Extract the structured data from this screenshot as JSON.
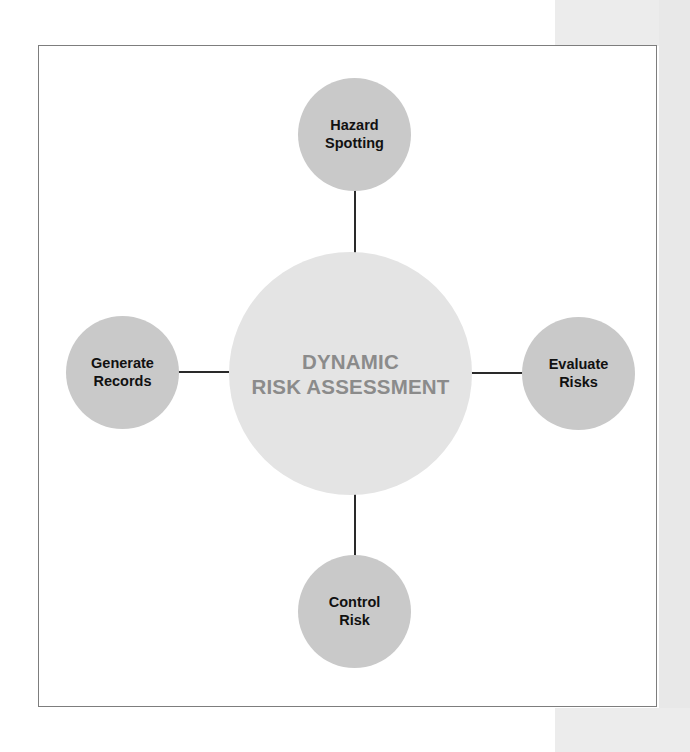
{
  "page": {
    "background_color": "#ffffff",
    "scan_margin_color": "#e8e8e8"
  },
  "frame": {
    "border_color": "#7d7d7d",
    "fill_color": "#ffffff"
  },
  "diagram": {
    "type": "hub-and-spoke",
    "center": {
      "id": "center",
      "label": "DYNAMIC\nRISK ASSESSMENT",
      "line1": "DYNAMIC",
      "line2": "RISK ASSESSMENT",
      "fill_color": "#e4e4e4",
      "text_color": "#8b8b8b"
    },
    "nodes": [
      {
        "id": "hazard-spotting",
        "label": "Hazard\nSpotting",
        "position": "top",
        "fill_color": "#c9c9c9",
        "text_color": "#111111"
      },
      {
        "id": "evaluate-risks",
        "label": "Evaluate\nRisks",
        "position": "right",
        "fill_color": "#c9c9c9",
        "text_color": "#111111"
      },
      {
        "id": "control-risk",
        "label": "Control\nRisk",
        "position": "bottom",
        "fill_color": "#c9c9c9",
        "text_color": "#111111"
      },
      {
        "id": "generate-records",
        "label": "Generate\nRecords",
        "position": "left",
        "fill_color": "#c9c9c9",
        "text_color": "#111111"
      }
    ],
    "connectors": [
      {
        "id": "connector-top",
        "from": "center",
        "to": "hazard-spotting",
        "color": "#2a2a2a"
      },
      {
        "id": "connector-right",
        "from": "center",
        "to": "evaluate-risks",
        "color": "#2a2a2a"
      },
      {
        "id": "connector-bottom",
        "from": "center",
        "to": "control-risk",
        "color": "#2a2a2a"
      },
      {
        "id": "connector-left",
        "from": "center",
        "to": "generate-records",
        "color": "#2a2a2a"
      }
    ]
  }
}
